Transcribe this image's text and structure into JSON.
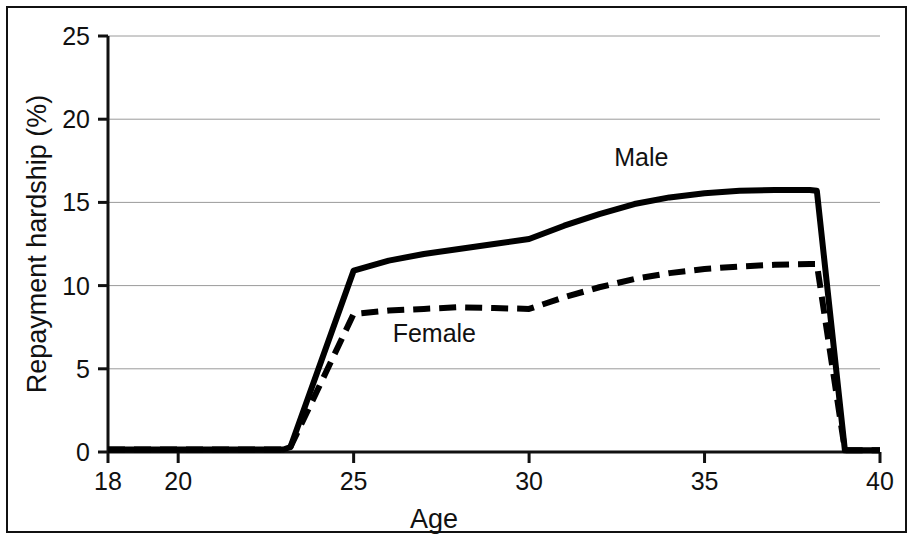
{
  "chart_data": {
    "type": "line",
    "title": "",
    "xlabel": "Age",
    "ylabel": "Repayment hardship (%)",
    "xlim": [
      18,
      40
    ],
    "ylim": [
      0,
      25
    ],
    "xticks": [
      18,
      20,
      25,
      30,
      35,
      40
    ],
    "xtick_labels": [
      "18",
      "20",
      "25",
      "30",
      "35",
      "40"
    ],
    "yticks": [
      0,
      5,
      10,
      15,
      20,
      25
    ],
    "ytick_labels": [
      "0",
      "5",
      "10",
      "15",
      "20",
      "25"
    ],
    "grid": "horizontal",
    "legend_position": "inline-annotations",
    "series": [
      {
        "name": "Male",
        "style": "solid",
        "color": "#000000",
        "label_x": 33.2,
        "label_y": 17.2,
        "x": [
          18,
          19,
          20,
          21,
          22,
          23,
          23.2,
          25,
          26,
          27,
          28,
          29,
          30,
          31,
          32,
          33,
          34,
          35,
          36,
          37,
          38,
          38.2,
          39,
          40
        ],
        "y": [
          0.15,
          0.15,
          0.15,
          0.15,
          0.15,
          0.15,
          0.3,
          10.9,
          11.5,
          11.9,
          12.2,
          12.5,
          12.8,
          13.6,
          14.3,
          14.9,
          15.3,
          15.55,
          15.7,
          15.75,
          15.75,
          15.7,
          0.1,
          0.1
        ]
      },
      {
        "name": "Female",
        "style": "dashed",
        "color": "#000000",
        "label_x": 27.3,
        "label_y": 6.6,
        "x": [
          18,
          19,
          20,
          21,
          22,
          23,
          23.2,
          25,
          26,
          27,
          28,
          29,
          30,
          31,
          32,
          33,
          34,
          35,
          36,
          37,
          38,
          38.2,
          39,
          40
        ],
        "y": [
          0.15,
          0.15,
          0.15,
          0.15,
          0.15,
          0.15,
          0.3,
          8.3,
          8.5,
          8.6,
          8.7,
          8.65,
          8.6,
          9.3,
          9.9,
          10.4,
          10.75,
          11.0,
          11.15,
          11.25,
          11.3,
          11.3,
          0.1,
          0.1
        ]
      }
    ]
  },
  "axes": {
    "x_axis_name": "age-axis",
    "y_axis_name": "repayment-hardship-axis"
  }
}
